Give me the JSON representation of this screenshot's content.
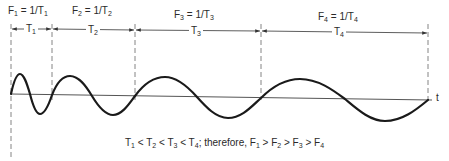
{
  "figure": {
    "axis_label": "t",
    "boundaries_x": [
      11,
      52,
      135,
      261,
      428
    ],
    "periods": [
      {
        "id": "T1",
        "period_label": "T",
        "period_sub": "1",
        "freq_label": "F",
        "freq_sub": "1",
        "formula_eq": " = 1/T",
        "formula_sub": "1"
      },
      {
        "id": "T2",
        "period_label": "T",
        "period_sub": "2",
        "freq_label": "F",
        "freq_sub": "2",
        "formula_eq": " = 1/T",
        "formula_sub": "2"
      },
      {
        "id": "T3",
        "period_label": "T",
        "period_sub": "3",
        "freq_label": "F",
        "freq_sub": "3",
        "formula_eq": " = 1/T",
        "formula_sub": "3"
      },
      {
        "id": "T4",
        "period_label": "T",
        "period_sub": "4",
        "freq_label": "F",
        "freq_sub": "4",
        "formula_eq": " = 1/T",
        "formula_sub": "4"
      }
    ],
    "caption": {
      "part1": "T",
      "s1": "1",
      "lt1": " < T",
      "s2": "2",
      "lt2": " < T",
      "s3": "3",
      "lt3": " < T",
      "s4": "4",
      "mid": "; therefore, F",
      "f1": "1",
      "gt1": " > F",
      "f2": "2",
      "gt2": " > F",
      "f3": "3",
      "gt3": " > F",
      "f4": "4"
    },
    "colors": {
      "line": "#1a1a1a",
      "axis": "#555555",
      "dash": "#777777"
    }
  }
}
